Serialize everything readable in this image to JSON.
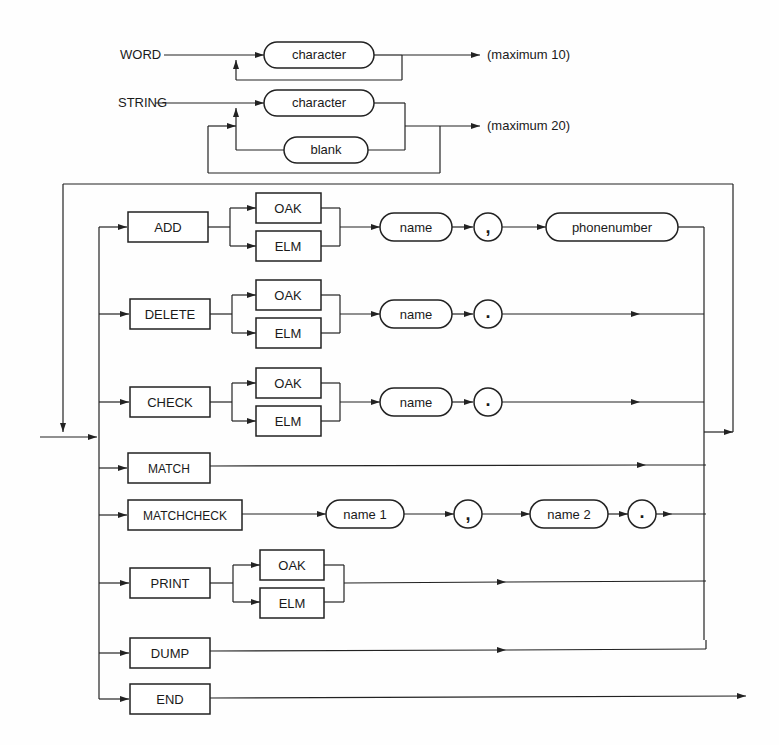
{
  "word_rule": {
    "name": "WORD",
    "item": "character",
    "note": "(maximum 10)"
  },
  "string_rule": {
    "name": "STRING",
    "items": [
      "character",
      "blank"
    ],
    "note": "(maximum 20)"
  },
  "commands": [
    {
      "keyword": "ADD",
      "options": [
        "OAK",
        "ELM"
      ],
      "sequence": [
        "name",
        ",",
        "phonenumber"
      ]
    },
    {
      "keyword": "DELETE",
      "options": [
        "OAK",
        "ELM"
      ],
      "sequence": [
        "name",
        "."
      ]
    },
    {
      "keyword": "CHECK",
      "options": [
        "OAK",
        "ELM"
      ],
      "sequence": [
        "name",
        "."
      ]
    },
    {
      "keyword": "MATCH",
      "options": [],
      "sequence": []
    },
    {
      "keyword": "MATCHCHECK",
      "options": [],
      "sequence": [
        "name 1",
        ",",
        "name 2",
        "."
      ]
    },
    {
      "keyword": "PRINT",
      "options": [
        "OAK",
        "ELM"
      ],
      "sequence": []
    },
    {
      "keyword": "DUMP",
      "options": [],
      "sequence": []
    },
    {
      "keyword": "END",
      "options": [],
      "sequence": []
    }
  ]
}
